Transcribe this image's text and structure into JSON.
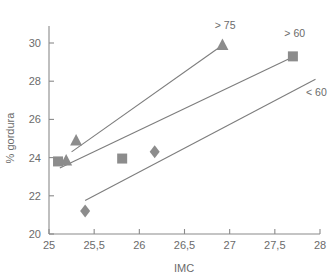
{
  "chart_data": {
    "type": "scatter",
    "title": "",
    "xlabel": "IMC",
    "ylabel": "% gordura",
    "xlim": [
      25,
      28
    ],
    "ylim": [
      20,
      30.8
    ],
    "grid": false,
    "legend_position": "inline-annotations",
    "x_ticks": [
      "25",
      "25,5",
      "26",
      "26,5",
      "27",
      "27,5",
      "28"
    ],
    "x_tick_values": [
      25,
      25.5,
      26,
      26.5,
      27,
      27.5,
      28
    ],
    "y_ticks": [
      "20",
      "22",
      "24",
      "26",
      "28",
      "30"
    ],
    "y_tick_values": [
      20,
      22,
      24,
      26,
      28,
      30
    ],
    "marker_color": "#8c8c8c",
    "line_color": "#7d7d7d",
    "series": [
      {
        "name": "> 75",
        "label": "> 75",
        "marker": "triangle",
        "points": [
          {
            "x": 25.19,
            "y": 23.85
          },
          {
            "x": 25.3,
            "y": 24.9
          },
          {
            "x": 26.92,
            "y": 29.9
          }
        ],
        "fit_line": {
          "x1": 25.25,
          "y1": 24.3,
          "x2": 26.88,
          "y2": 29.75
        },
        "label_pos": {
          "x": 26.95,
          "y": 30.75
        }
      },
      {
        "name": "> 60",
        "label": "> 60",
        "marker": "square",
        "points": [
          {
            "x": 25.1,
            "y": 23.8
          },
          {
            "x": 25.81,
            "y": 23.95
          },
          {
            "x": 27.7,
            "y": 29.3
          }
        ],
        "fit_line": {
          "x1": 25.12,
          "y1": 23.45,
          "x2": 27.67,
          "y2": 29.2
        },
        "label_pos": {
          "x": 27.72,
          "y": 30.3
        }
      },
      {
        "name": "< 60",
        "label": "< 60",
        "marker": "diamond",
        "points": [
          {
            "x": 25.4,
            "y": 21.2
          },
          {
            "x": 26.17,
            "y": 24.3
          }
        ],
        "fit_line": {
          "x1": 25.4,
          "y1": 21.75,
          "x2": 27.95,
          "y2": 28.1
        },
        "label_pos": {
          "x": 27.96,
          "y": 27.2
        }
      }
    ]
  }
}
